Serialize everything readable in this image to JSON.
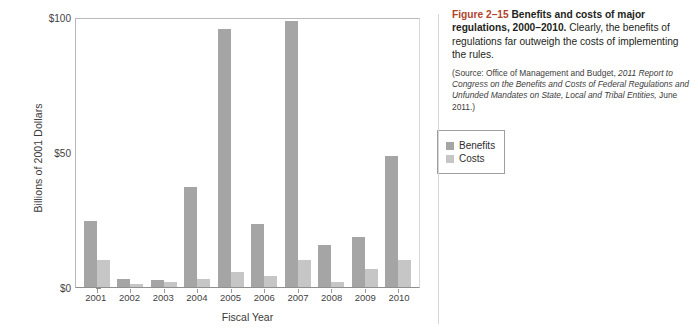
{
  "figure": {
    "number": "Figure 2–15",
    "title": "Benefits and costs of major regulations, 2000–2010.",
    "description": "Clearly, the benefits of regulations far outweigh the costs of implementing the rules.",
    "source_prefix": "(Source:",
    "source_roman_1": " Office of Management and Budget, ",
    "source_italic_1": "2011 Report to Congress on the Benefits and Costs of Federal Regulations and Unfunded Mandates on State, Local and Tribal Entities,",
    "source_roman_2": " June 2011.)"
  },
  "legend": {
    "position": "inside-right",
    "items": [
      {
        "label": "Benefits",
        "color": "#a5a5a5"
      },
      {
        "label": "Costs",
        "color": "#c6c6c6"
      }
    ]
  },
  "axes": {
    "y_title": "Billions of 2001 Dollars",
    "x_title": "Fiscal Year",
    "y_ticks": [
      "$0",
      "$50",
      "$100"
    ],
    "y_min": 0,
    "y_max": 100
  },
  "chart_data": {
    "type": "bar",
    "title": "Benefits and costs of major regulations, 2000–2010",
    "xlabel": "Fiscal Year",
    "ylabel": "Billions of 2001 Dollars",
    "ylim": [
      0,
      100
    ],
    "yticks": [
      0,
      50,
      100
    ],
    "ytick_labels": [
      "$0",
      "$50",
      "$100"
    ],
    "grid": false,
    "legend_position": "inside-right",
    "categories": [
      "2001",
      "2002",
      "2003",
      "2004",
      "2005",
      "2006",
      "2007",
      "2008",
      "2009",
      "2010"
    ],
    "series": [
      {
        "name": "Benefits",
        "color": "#a5a5a5",
        "values": [
          24.5,
          3.0,
          2.5,
          37.0,
          95.5,
          23.5,
          98.5,
          15.5,
          18.5,
          48.5
        ]
      },
      {
        "name": "Costs",
        "color": "#c6c6c6",
        "values": [
          10.0,
          1.0,
          2.0,
          3.0,
          5.5,
          4.0,
          10.0,
          2.0,
          6.5,
          10.0
        ]
      }
    ]
  }
}
